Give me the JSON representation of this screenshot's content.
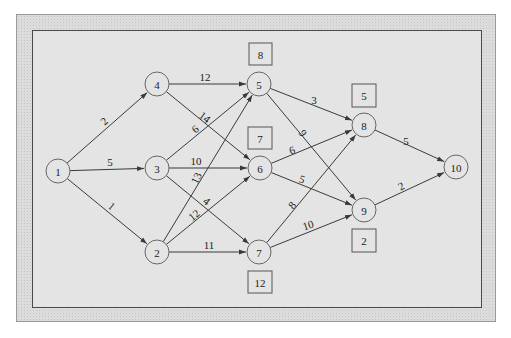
{
  "diagram": {
    "type": "directed network",
    "nodes": [
      {
        "id": "1",
        "label": "1",
        "x": 58,
        "y": 171
      },
      {
        "id": "2",
        "label": "2",
        "x": 157,
        "y": 252
      },
      {
        "id": "3",
        "label": "3",
        "x": 157,
        "y": 168
      },
      {
        "id": "4",
        "label": "4",
        "x": 157,
        "y": 84
      },
      {
        "id": "5",
        "label": "5",
        "x": 259,
        "y": 84
      },
      {
        "id": "6",
        "label": "6",
        "x": 260,
        "y": 168
      },
      {
        "id": "7",
        "label": "7",
        "x": 259,
        "y": 252
      },
      {
        "id": "8",
        "label": "8",
        "x": 364,
        "y": 125
      },
      {
        "id": "9",
        "label": "9",
        "x": 364,
        "y": 210
      },
      {
        "id": "10",
        "label": "10",
        "x": 456,
        "y": 167
      }
    ],
    "edges": [
      {
        "from": "1",
        "to": "4",
        "weight": "2",
        "lx": 104,
        "ly": 121,
        "rot": -43
      },
      {
        "from": "1",
        "to": "3",
        "weight": "5",
        "lx": 110,
        "ly": 162,
        "rot": 0
      },
      {
        "from": "1",
        "to": "2",
        "weight": "1",
        "lx": 112,
        "ly": 206,
        "rot": 40
      },
      {
        "from": "4",
        "to": "5",
        "weight": "12",
        "lx": 205,
        "ly": 77,
        "rot": 0
      },
      {
        "from": "4",
        "to": "6",
        "weight": "14",
        "lx": 205,
        "ly": 117,
        "rot": 38
      },
      {
        "from": "3",
        "to": "5",
        "weight": "6",
        "lx": 195,
        "ly": 129,
        "rot": -40
      },
      {
        "from": "3",
        "to": "6",
        "weight": "10",
        "lx": 196,
        "ly": 161,
        "rot": 0
      },
      {
        "from": "3",
        "to": "7",
        "weight": "4",
        "lx": 207,
        "ly": 201,
        "rot": 38
      },
      {
        "from": "2",
        "to": "5",
        "weight": "13",
        "lx": 196,
        "ly": 178,
        "rot": -65
      },
      {
        "from": "2",
        "to": "6",
        "weight": "12",
        "lx": 194,
        "ly": 215,
        "rot": -40
      },
      {
        "from": "2",
        "to": "7",
        "weight": "11",
        "lx": 209,
        "ly": 245,
        "rot": 0
      },
      {
        "from": "5",
        "to": "8",
        "weight": "3",
        "lx": 314,
        "ly": 100,
        "rot": 0
      },
      {
        "from": "5",
        "to": "9",
        "weight": "9",
        "lx": 303,
        "ly": 133,
        "rot": 55
      },
      {
        "from": "6",
        "to": "8",
        "weight": "6",
        "lx": 292,
        "ly": 150,
        "rot": -20
      },
      {
        "from": "6",
        "to": "9",
        "weight": "5",
        "lx": 302,
        "ly": 179,
        "rot": 18
      },
      {
        "from": "7",
        "to": "8",
        "weight": "8",
        "lx": 292,
        "ly": 205,
        "rot": -50
      },
      {
        "from": "7",
        "to": "9",
        "weight": "10",
        "lx": 308,
        "ly": 225,
        "rot": -18
      },
      {
        "from": "8",
        "to": "10",
        "weight": "5",
        "lx": 406,
        "ly": 141,
        "rot": 0
      },
      {
        "from": "9",
        "to": "10",
        "weight": "2",
        "lx": 401,
        "ly": 186,
        "rot": -28
      }
    ],
    "slack_boxes": [
      {
        "node": "5",
        "value": "8",
        "x": 249,
        "y": 43,
        "w": 23,
        "h": 22
      },
      {
        "node": "6",
        "value": "7",
        "x": 248,
        "y": 127,
        "w": 24,
        "h": 22
      },
      {
        "node": "7",
        "value": "12",
        "x": 248,
        "y": 271,
        "w": 24,
        "h": 22
      },
      {
        "node": "8",
        "value": "5",
        "x": 352,
        "y": 84,
        "w": 24,
        "h": 23
      },
      {
        "node": "9",
        "value": "2",
        "x": 352,
        "y": 229,
        "w": 24,
        "h": 23
      }
    ],
    "colors": {
      "panel": "#e4e4e4",
      "frame": "#dcdcdc",
      "stroke": "#3a3a3a"
    }
  }
}
